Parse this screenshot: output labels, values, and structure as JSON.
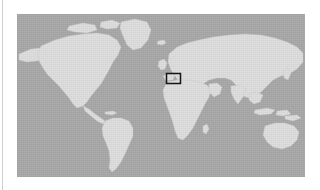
{
  "figure": {
    "name": "world-map-locator",
    "caption": ""
  },
  "map": {
    "projection": "equirectangular",
    "ocean_color": "#a9a9a9",
    "land_color": "#dedede",
    "land_edge_color": "#c9c9c9",
    "frame": {
      "x": 17,
      "y": 14,
      "width": 288,
      "height": 163
    },
    "lon_range": [
      -180,
      180
    ],
    "lat_range": [
      -62,
      84
    ],
    "landmasses": [
      "north-america",
      "greenland",
      "south-america",
      "africa",
      "europe",
      "asia",
      "australia",
      "new-zealand",
      "madagascar",
      "british-isles",
      "japan",
      "indonesia",
      "iceland"
    ]
  },
  "region_highlight": {
    "label": "Central Europe",
    "outline_color": "#111111",
    "outline_width_px": 1.5,
    "fill": "none",
    "box_px": {
      "x": 149,
      "y": 59,
      "width": 15,
      "height": 11
    },
    "approx_bounds_deg": {
      "west": 5,
      "east": 20,
      "south": 45,
      "north": 55
    }
  },
  "page": {
    "background_color": "#ffffff",
    "edge_rule_color": "#cfcfcf"
  }
}
